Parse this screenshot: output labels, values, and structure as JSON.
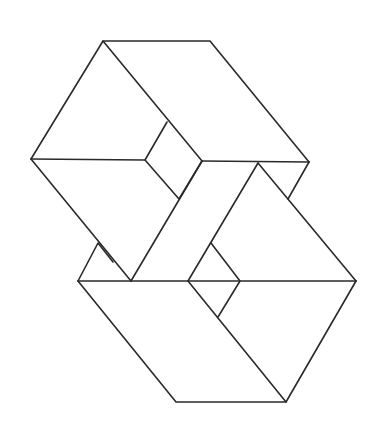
{
  "figure": {
    "type": "impossible-figure line drawing",
    "stroke_color": "#2a2a2a",
    "background": "#ffffff"
  }
}
